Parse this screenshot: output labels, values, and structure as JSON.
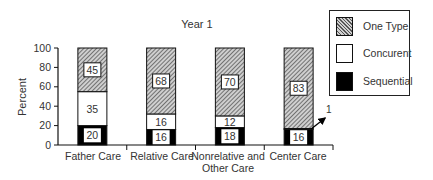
{
  "chart_data": {
    "type": "bar",
    "stacked": true,
    "title": "Year 1",
    "xlabel": "",
    "ylabel": "Percent",
    "ylim": [
      0,
      100
    ],
    "yticks": [
      0,
      20,
      40,
      60,
      80,
      100
    ],
    "grid": false,
    "legend_position": "top-right",
    "categories": [
      "Father Care",
      "Relative Care",
      "Nonrelative and Other Care",
      "Center Care"
    ],
    "series": [
      {
        "name": "Sequential",
        "fill": "black",
        "values": [
          20,
          16,
          18,
          16
        ]
      },
      {
        "name": "Concurent",
        "fill": "white",
        "values": [
          35,
          16,
          12,
          1
        ]
      },
      {
        "name": "One Type",
        "fill": "hatched",
        "values": [
          45,
          68,
          70,
          83
        ]
      }
    ],
    "annotations": [
      {
        "category": "Center Care",
        "series": "Concurent",
        "text": "1",
        "style": "arrow"
      }
    ]
  },
  "title": "Year 1",
  "ylabel": "Percent",
  "yticks": [
    "0",
    "20",
    "40",
    "60",
    "80",
    "100"
  ],
  "xlabels": {
    "c0": "Father Care",
    "c1": "Relative Care",
    "c2_line1": "Nonrelative and",
    "c2_line2": "Other Care",
    "c3": "Center Care"
  },
  "legend": {
    "items": [
      {
        "label": "One Type",
        "swatch": "hatched"
      },
      {
        "label": "Concurent",
        "swatch": "white"
      },
      {
        "label": "Sequential",
        "swatch": "black"
      }
    ]
  },
  "annotation_text": "1"
}
